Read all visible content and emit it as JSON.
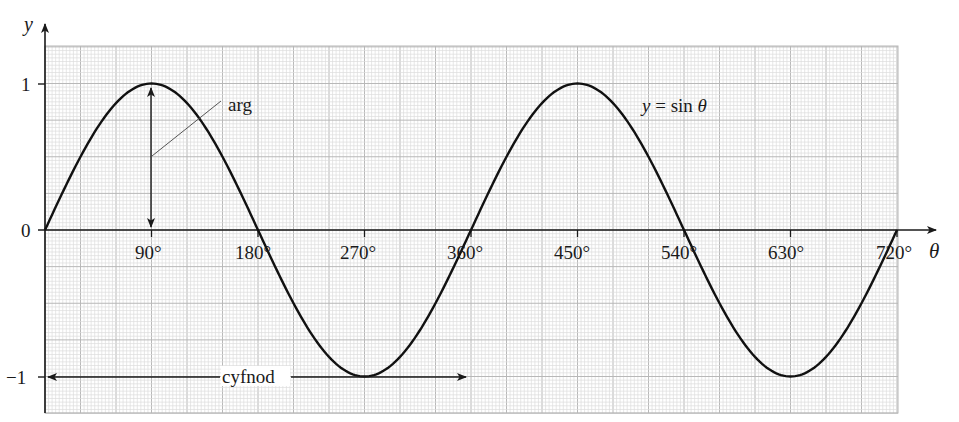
{
  "chart_data": {
    "type": "line",
    "title": "",
    "xlabel": "θ",
    "ylabel": "y",
    "series": [
      {
        "name": "y = sin θ",
        "function": "sin",
        "x_start": 0,
        "x_end": 720,
        "color": "#111111"
      }
    ],
    "x_ticks": [
      90,
      180,
      270,
      360,
      450,
      540,
      630,
      720
    ],
    "x_tick_labels": [
      "90°",
      "180°",
      "270°",
      "360°",
      "450°",
      "540°",
      "630°",
      "720°"
    ],
    "y_ticks": [
      1,
      0,
      -1
    ],
    "y_tick_labels": [
      "1",
      "0",
      "−1"
    ],
    "xlim": [
      0,
      720
    ],
    "ylim": [
      -1.25,
      1.25
    ],
    "grid": true,
    "grid_major_x_step": 30,
    "grid_major_y_step": 0.25,
    "annotations": [
      {
        "label": "arg",
        "meaning": "amplitude",
        "type": "double-arrow",
        "x": 90,
        "y_from": 0,
        "y_to": 1
      },
      {
        "label": "cyfnod",
        "meaning": "period",
        "type": "double-arrow",
        "y": -1,
        "x_from": 0,
        "x_to": 360
      },
      {
        "label": "y = sin θ",
        "type": "curve-label",
        "x": 520,
        "y": 0.7
      }
    ],
    "key_points": [
      {
        "x": 0,
        "y": 0
      },
      {
        "x": 90,
        "y": 1
      },
      {
        "x": 180,
        "y": 0
      },
      {
        "x": 270,
        "y": -1
      },
      {
        "x": 360,
        "y": 0
      },
      {
        "x": 450,
        "y": 1
      },
      {
        "x": 540,
        "y": 0
      },
      {
        "x": 630,
        "y": -1
      },
      {
        "x": 720,
        "y": 0
      }
    ]
  },
  "labels": {
    "y_axis": "y",
    "x_axis": "θ",
    "amplitude": "arg",
    "period": "cyfnod",
    "curve_eq_y": "y",
    "curve_eq_rest": " = sin ",
    "curve_eq_theta": "θ",
    "y1": "1",
    "y0": "0",
    "ym1": "−1",
    "x90": "90°",
    "x180": "180°",
    "x270": "270°",
    "x360": "360°",
    "x450": "450°",
    "x540": "540°",
    "x630": "630°",
    "x720": "720°"
  },
  "colors": {
    "curve": "#111111",
    "axis": "#1a1a1a",
    "grid_minor": "#dcdcdc",
    "grid_major": "#b8b8b8",
    "pointer": "#555555"
  }
}
